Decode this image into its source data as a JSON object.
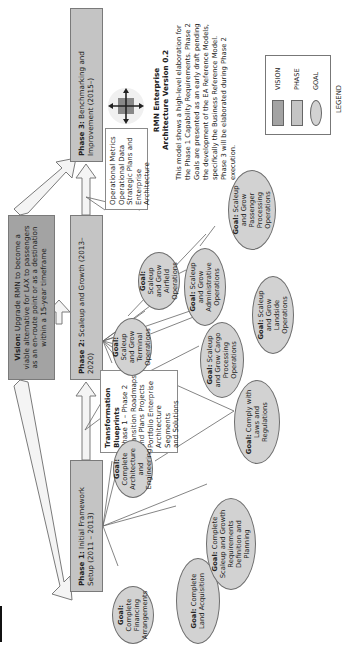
{
  "title": {
    "line1": "RMN Enterprise",
    "line2": "Architecture Version 0.2"
  },
  "description": "This model shows a high-level elaboration for the Phase 1 Capability Requirements. Phase 2 Goals are presented as an early draft pending the development of the EA Reference Models, specifically the Business Reference Model. Phase 3 will be elaborated during Phase 2 execution.",
  "vision": {
    "label": "Vision:",
    "text": "Upgrade RMN to become a viable alternative for LAX to passengers as an en-route point or as a destination within a 15-year timeframe"
  },
  "phases": [
    {
      "label": "Phase 1:",
      "text": "Initial Framework Setup (2011 – 2013)"
    },
    {
      "label": "Phase 2:",
      "text": "Scaleup and Growth (2013–2020)"
    },
    {
      "label": "Phase 3:",
      "text": "Benchmarking and Improvement (2015–)"
    }
  ],
  "notes": {
    "operational": [
      "Operational Metrics",
      "Operational Data",
      "Strategic Plans and",
      "Enterprise Architecture"
    ],
    "transformation_title": "Transformation Blueprints",
    "transformation_lines": [
      "Phase 1 – Phase 2",
      "Transition Roadmaps",
      "and Plans Projects",
      "Portfolio Enterprise",
      "Architecture Segments",
      "and Solutions"
    ]
  },
  "goals": {
    "prefix": "Goal:",
    "phase1": [
      "Complete Financing Arrangements",
      "Complete Land Acquisition",
      "Complete Scaleup and Growth Requirements Definition and Planning",
      "Complete Architecture and Engineering"
    ],
    "phase2": [
      "Scaleup and Grow Terminal Operations",
      "Scaleup and Grow Airfield Operations",
      "Scaleup and Grow Administrative Operations",
      "Scaleup and Grow Passenger Processing Operations",
      "Scaleup and Grow Cargo Processing Operations",
      "Scaleup and Grow Landside Operations",
      "Comply with Laws and Regulations"
    ]
  },
  "legend": {
    "items": [
      {
        "label": "VISION",
        "color": "#a3a3a3"
      },
      {
        "label": "PHASE",
        "color": "#c4c4c4"
      },
      {
        "label": "GOAL",
        "color": "#d2d2d2"
      }
    ],
    "caption": "LEGEND"
  },
  "logo": {
    "icon": "airport-compass-logo-icon"
  }
}
